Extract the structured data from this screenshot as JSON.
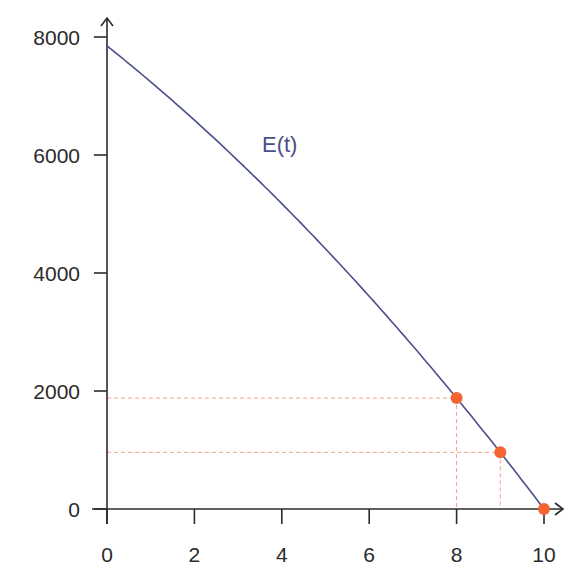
{
  "chart_data": {
    "type": "line",
    "title": "",
    "xlabel": "",
    "ylabel": "",
    "xlim": [
      0,
      10
    ],
    "ylim": [
      0,
      8000
    ],
    "x_ticks": [
      0,
      2,
      4,
      6,
      8,
      10
    ],
    "y_ticks": [
      0,
      2000,
      4000,
      6000,
      8000
    ],
    "x_tick_labels": [
      "0",
      "2",
      "4",
      "6",
      "8",
      "10"
    ],
    "y_tick_labels": [
      "0",
      "2000",
      "4000",
      "6000",
      "8000"
    ],
    "grid": false,
    "series": [
      {
        "name": "E(t)",
        "color": "#4a4f8a",
        "x": [
          0,
          1,
          2,
          3,
          4,
          5,
          6,
          7,
          8,
          9,
          10
        ],
        "values": [
          7850,
          7240,
          6590,
          5902,
          5176,
          4410,
          3606,
          2764,
          1880,
          960,
          0
        ]
      }
    ],
    "highlight_points": [
      {
        "x": 8,
        "y": 1880
      },
      {
        "x": 9,
        "y": 960
      },
      {
        "x": 10,
        "y": 0
      }
    ],
    "highlight_color": "#f26430",
    "guide_line_color": "#f4a08a",
    "annotations": [
      {
        "text": "E(t)",
        "x": 3.6,
        "y": 6400
      }
    ]
  }
}
